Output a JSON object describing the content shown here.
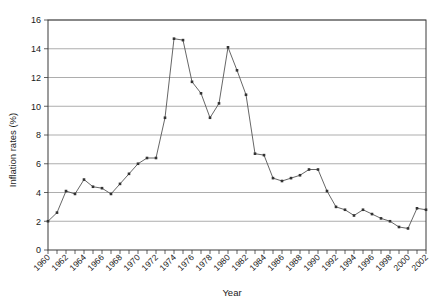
{
  "chart_data": {
    "type": "line",
    "title": "",
    "xlabel": "Year",
    "ylabel": "Inflation rates (%)",
    "xlim": [
      1960,
      2002
    ],
    "ylim": [
      0,
      16
    ],
    "ytick_step": 2,
    "yticks": [
      0,
      2,
      4,
      6,
      8,
      10,
      12,
      14,
      16
    ],
    "xticks_labeled": [
      1960,
      1962,
      1964,
      1966,
      1968,
      1970,
      1972,
      1974,
      1976,
      1978,
      1980,
      1982,
      1984,
      1986,
      1988,
      1990,
      1992,
      1994,
      1996,
      1998,
      2000,
      2002
    ],
    "xticks_all": [
      1960,
      1961,
      1962,
      1963,
      1964,
      1965,
      1966,
      1967,
      1968,
      1969,
      1970,
      1971,
      1972,
      1973,
      1974,
      1975,
      1976,
      1977,
      1978,
      1979,
      1980,
      1981,
      1982,
      1983,
      1984,
      1985,
      1986,
      1987,
      1988,
      1989,
      1990,
      1991,
      1992,
      1993,
      1994,
      1995,
      1996,
      1997,
      1998,
      1999,
      2000,
      2001,
      2002
    ],
    "grid": true,
    "grid_axis": "y",
    "legend": false,
    "legend_position": "none",
    "markers": true,
    "series": [
      {
        "name": "Inflation rate",
        "color": "#555555",
        "x": [
          1960,
          1961,
          1962,
          1963,
          1964,
          1965,
          1966,
          1967,
          1968,
          1969,
          1970,
          1971,
          1972,
          1973,
          1974,
          1975,
          1976,
          1977,
          1978,
          1979,
          1980,
          1981,
          1982,
          1983,
          1984,
          1985,
          1986,
          1987,
          1988,
          1989,
          1990,
          1991,
          1992,
          1993,
          1994,
          1995,
          1996,
          1997,
          1998,
          1999,
          2000,
          2001,
          2002
        ],
        "values": [
          2.0,
          2.6,
          4.1,
          3.9,
          4.9,
          4.4,
          4.3,
          3.9,
          4.6,
          5.3,
          6.0,
          6.4,
          6.4,
          9.2,
          14.7,
          14.6,
          11.7,
          10.9,
          9.2,
          10.2,
          14.1,
          12.5,
          10.8,
          6.7,
          6.6,
          5.0,
          4.8,
          5.0,
          5.2,
          5.6,
          5.6,
          4.1,
          3.0,
          2.8,
          2.4,
          2.8,
          2.5,
          2.2,
          2.0,
          1.6,
          1.5,
          2.9,
          2.8
        ]
      }
    ]
  },
  "axis": {
    "ylabel": "Inflation rates (%)",
    "xlabel": "Year"
  }
}
